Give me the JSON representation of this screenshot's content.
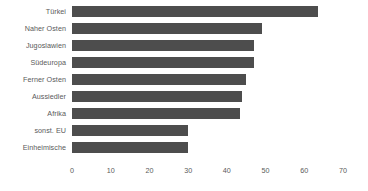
{
  "chart_data": {
    "type": "bar",
    "orientation": "horizontal",
    "title": "",
    "subtitle": "",
    "xlabel": "",
    "ylabel": "",
    "categories": [
      "Türkei",
      "Naher Osten",
      "Jugoslawien",
      "Südeuropa",
      "Ferner Osten",
      "Aussiedler",
      "Afrika",
      "sonst. EU",
      "Einheimische"
    ],
    "values": [
      63.5,
      49,
      47,
      47,
      45,
      44,
      43.5,
      30,
      30
    ],
    "series": [
      {
        "name": "",
        "values": [
          63.5,
          49,
          47,
          47,
          45,
          44,
          43.5,
          30,
          30
        ]
      }
    ],
    "xlim": [
      0,
      70
    ],
    "xticks": [
      0,
      10,
      20,
      30,
      40,
      50,
      60,
      70
    ],
    "xtick_labels": [
      "0",
      "10",
      "20",
      "30",
      "40",
      "50",
      "60",
      "70"
    ],
    "grid": false,
    "legend": false,
    "legend_position": "none",
    "bar_color": "#4d4d4d",
    "text_color": "#5a5a5a",
    "background_color": "#ffffff"
  }
}
